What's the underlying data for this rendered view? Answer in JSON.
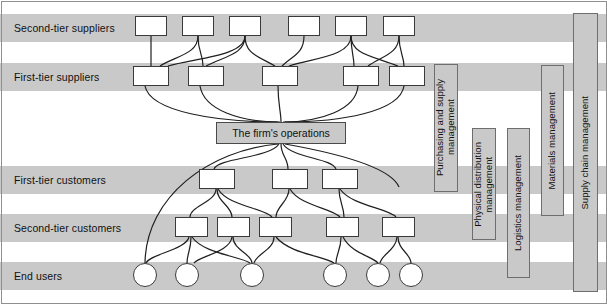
{
  "diagram": {
    "colors": {
      "band": "#c9c9c9",
      "node_fill": "#ffffff",
      "node_stroke": "#3a3a3a",
      "firm_fill": "#c9c9c9",
      "bar_fill": "#c9c9c9",
      "bar_stroke": "#6e6e6e",
      "text": "#111111",
      "frame": "#8f8f8f"
    },
    "rows": [
      {
        "id": "second-tier-suppliers",
        "label": "Second-tier suppliers",
        "band": {
          "y": 14,
          "h": 28
        },
        "label_x": 14,
        "label_y": 28,
        "node_shape": "box",
        "nodes": [
          {
            "x": 135,
            "y": 16,
            "w": 32,
            "h": 20
          },
          {
            "x": 182,
            "y": 16,
            "w": 32,
            "h": 20
          },
          {
            "x": 229,
            "y": 16,
            "w": 32,
            "h": 20
          },
          {
            "x": 288,
            "y": 16,
            "w": 32,
            "h": 20
          },
          {
            "x": 335,
            "y": 16,
            "w": 32,
            "h": 20
          },
          {
            "x": 383,
            "y": 16,
            "w": 32,
            "h": 20
          }
        ]
      },
      {
        "id": "first-tier-suppliers",
        "label": "First-tier suppliers",
        "band": {
          "y": 63,
          "h": 28
        },
        "label_x": 14,
        "label_y": 77,
        "node_shape": "box",
        "nodes": [
          {
            "x": 133,
            "y": 66,
            "w": 36,
            "h": 20
          },
          {
            "x": 188,
            "y": 66,
            "w": 36,
            "h": 20
          },
          {
            "x": 262,
            "y": 66,
            "w": 36,
            "h": 20
          },
          {
            "x": 343,
            "y": 66,
            "w": 36,
            "h": 20
          },
          {
            "x": 389,
            "y": 66,
            "w": 36,
            "h": 20
          }
        ]
      },
      {
        "id": "first-tier-customers",
        "label": "First-tier customers",
        "band": {
          "y": 166,
          "h": 28
        },
        "label_x": 14,
        "label_y": 180,
        "node_shape": "box",
        "nodes": [
          {
            "x": 199,
            "y": 169,
            "w": 36,
            "h": 20
          },
          {
            "x": 272,
            "y": 169,
            "w": 36,
            "h": 20
          },
          {
            "x": 322,
            "y": 169,
            "w": 36,
            "h": 20
          }
        ]
      },
      {
        "id": "second-tier-customers",
        "label": "Second-tier customers",
        "band": {
          "y": 214,
          "h": 28
        },
        "label_x": 14,
        "label_y": 228,
        "node_shape": "box",
        "nodes": [
          {
            "x": 175,
            "y": 217,
            "w": 33,
            "h": 20
          },
          {
            "x": 217,
            "y": 217,
            "w": 33,
            "h": 20
          },
          {
            "x": 259,
            "y": 217,
            "w": 33,
            "h": 20
          },
          {
            "x": 326,
            "y": 217,
            "w": 33,
            "h": 20
          },
          {
            "x": 382,
            "y": 217,
            "w": 33,
            "h": 20
          }
        ]
      },
      {
        "id": "end-users",
        "label": "End users",
        "band": {
          "y": 262,
          "h": 28
        },
        "label_x": 14,
        "label_y": 276,
        "node_shape": "circle",
        "nodes": [
          {
            "x": 133,
            "y": 263,
            "w": 24,
            "h": 24
          },
          {
            "x": 175,
            "y": 263,
            "w": 24,
            "h": 24
          },
          {
            "x": 240,
            "y": 263,
            "w": 24,
            "h": 24
          },
          {
            "x": 323,
            "y": 263,
            "w": 24,
            "h": 24
          },
          {
            "x": 366,
            "y": 263,
            "w": 24,
            "h": 24
          },
          {
            "x": 399,
            "y": 263,
            "w": 24,
            "h": 24
          }
        ]
      }
    ],
    "firm": {
      "label": "The firm's operations",
      "x": 216,
      "y": 122,
      "w": 130,
      "h": 22
    },
    "scope_bars": [
      {
        "id": "purchasing-and-supply-management",
        "label": "Purchasing and supply\nmanagement",
        "x": 434,
        "y": 64,
        "w": 24,
        "h": 128
      },
      {
        "id": "physical-distribution-management",
        "label": "Physical distribution\nmanagement",
        "x": 472,
        "y": 128,
        "w": 24,
        "h": 112
      },
      {
        "id": "logistics-management",
        "label": "Logistics management",
        "x": 507,
        "y": 128,
        "w": 23,
        "h": 150
      },
      {
        "id": "materials-management",
        "label": "Materials management",
        "x": 541,
        "y": 65,
        "w": 23,
        "h": 151
      },
      {
        "id": "supply-chain-management",
        "label": "Supply chain management",
        "x": 573,
        "y": 13,
        "w": 25,
        "h": 279
      }
    ],
    "edges": [
      {
        "from": [
          151,
          36
        ],
        "to": [
          151,
          66
        ],
        "c1": [
          151,
          48
        ],
        "c2": [
          151,
          56
        ]
      },
      {
        "from": [
          198,
          36
        ],
        "to": [
          160,
          66
        ],
        "c1": [
          198,
          54
        ],
        "c2": [
          176,
          56
        ]
      },
      {
        "from": [
          245,
          36
        ],
        "to": [
          168,
          66
        ],
        "c1": [
          245,
          56
        ],
        "c2": [
          196,
          58
        ]
      },
      {
        "from": [
          245,
          36
        ],
        "to": [
          206,
          66
        ],
        "c1": [
          245,
          54
        ],
        "c2": [
          226,
          56
        ]
      },
      {
        "from": [
          245,
          36
        ],
        "to": [
          275,
          66
        ],
        "c1": [
          245,
          54
        ],
        "c2": [
          258,
          56
        ]
      },
      {
        "from": [
          198,
          36
        ],
        "to": [
          203,
          66
        ],
        "c1": [
          198,
          52
        ],
        "c2": [
          203,
          54
        ]
      },
      {
        "from": [
          304,
          36
        ],
        "to": [
          282,
          66
        ],
        "c1": [
          304,
          54
        ],
        "c2": [
          292,
          56
        ]
      },
      {
        "from": [
          351,
          36
        ],
        "to": [
          289,
          66
        ],
        "c1": [
          351,
          56
        ],
        "c2": [
          315,
          58
        ]
      },
      {
        "from": [
          351,
          36
        ],
        "to": [
          354,
          66
        ],
        "c1": [
          351,
          52
        ],
        "c2": [
          354,
          56
        ]
      },
      {
        "from": [
          399,
          36
        ],
        "to": [
          368,
          66
        ],
        "c1": [
          399,
          54
        ],
        "c2": [
          382,
          56
        ]
      },
      {
        "from": [
          399,
          36
        ],
        "to": [
          404,
          66
        ],
        "c1": [
          399,
          52
        ],
        "c2": [
          404,
          56
        ]
      },
      {
        "from": [
          351,
          36
        ],
        "to": [
          398,
          66
        ],
        "c1": [
          351,
          54
        ],
        "c2": [
          372,
          56
        ]
      },
      {
        "from": [
          145,
          86
        ],
        "to": [
          278,
          122
        ],
        "c1": [
          150,
          112
        ],
        "c2": [
          218,
          122
        ]
      },
      {
        "from": [
          200,
          86
        ],
        "to": [
          280,
          122
        ],
        "c1": [
          204,
          110
        ],
        "c2": [
          240,
          122
        ]
      },
      {
        "from": [
          278,
          86
        ],
        "to": [
          281,
          122
        ],
        "c1": [
          278,
          104
        ],
        "c2": [
          281,
          112
        ]
      },
      {
        "from": [
          358,
          86
        ],
        "to": [
          283,
          122
        ],
        "c1": [
          356,
          110
        ],
        "c2": [
          320,
          122
        ]
      },
      {
        "from": [
          404,
          86
        ],
        "to": [
          285,
          122
        ],
        "c1": [
          400,
          112
        ],
        "c2": [
          340,
          122
        ]
      },
      {
        "from": [
          278,
          144
        ],
        "to": [
          145,
          263
        ],
        "c1": [
          210,
          150
        ],
        "c2": [
          146,
          196
        ]
      },
      {
        "from": [
          279,
          144
        ],
        "to": [
          214,
          169
        ],
        "c1": [
          270,
          158
        ],
        "c2": [
          218,
          158
        ]
      },
      {
        "from": [
          281,
          144
        ],
        "to": [
          288,
          169
        ],
        "c1": [
          281,
          156
        ],
        "c2": [
          288,
          158
        ]
      },
      {
        "from": [
          283,
          144
        ],
        "to": [
          336,
          169
        ],
        "c1": [
          292,
          158
        ],
        "c2": [
          332,
          158
        ]
      },
      {
        "from": [
          285,
          144
        ],
        "to": [
          399,
          187
        ],
        "c1": [
          330,
          152
        ],
        "c2": [
          390,
          166
        ]
      },
      {
        "from": [
          216,
          189
        ],
        "to": [
          190,
          217
        ],
        "c1": [
          216,
          202
        ],
        "c2": [
          190,
          206
        ]
      },
      {
        "from": [
          217,
          189
        ],
        "to": [
          232,
          217
        ],
        "c1": [
          217,
          202
        ],
        "c2": [
          232,
          206
        ]
      },
      {
        "from": [
          218,
          189
        ],
        "to": [
          272,
          217
        ],
        "c1": [
          228,
          206
        ],
        "c2": [
          264,
          208
        ]
      },
      {
        "from": [
          289,
          189
        ],
        "to": [
          276,
          217
        ],
        "c1": [
          289,
          202
        ],
        "c2": [
          276,
          206
        ]
      },
      {
        "from": [
          290,
          189
        ],
        "to": [
          340,
          217
        ],
        "c1": [
          300,
          206
        ],
        "c2": [
          332,
          208
        ]
      },
      {
        "from": [
          339,
          189
        ],
        "to": [
          344,
          217
        ],
        "c1": [
          339,
          202
        ],
        "c2": [
          344,
          206
        ]
      },
      {
        "from": [
          340,
          189
        ],
        "to": [
          396,
          217
        ],
        "c1": [
          352,
          206
        ],
        "c2": [
          388,
          208
        ]
      },
      {
        "from": [
          189,
          237
        ],
        "to": [
          146,
          263
        ],
        "c1": [
          186,
          250
        ],
        "c2": [
          150,
          254
        ]
      },
      {
        "from": [
          191,
          237
        ],
        "to": [
          187,
          263
        ],
        "c1": [
          191,
          250
        ],
        "c2": [
          187,
          254
        ]
      },
      {
        "from": [
          192,
          237
        ],
        "to": [
          250,
          263
        ],
        "c1": [
          204,
          254
        ],
        "c2": [
          240,
          256
        ]
      },
      {
        "from": [
          232,
          237
        ],
        "to": [
          194,
          263
        ],
        "c1": [
          230,
          252
        ],
        "c2": [
          200,
          256
        ]
      },
      {
        "from": [
          233,
          237
        ],
        "to": [
          252,
          263
        ],
        "c1": [
          233,
          250
        ],
        "c2": [
          252,
          254
        ]
      },
      {
        "from": [
          274,
          237
        ],
        "to": [
          254,
          263
        ],
        "c1": [
          274,
          250
        ],
        "c2": [
          256,
          254
        ]
      },
      {
        "from": [
          276,
          237
        ],
        "to": [
          334,
          263
        ],
        "c1": [
          290,
          254
        ],
        "c2": [
          324,
          256
        ]
      },
      {
        "from": [
          341,
          237
        ],
        "to": [
          336,
          263
        ],
        "c1": [
          341,
          250
        ],
        "c2": [
          336,
          254
        ]
      },
      {
        "from": [
          343,
          237
        ],
        "to": [
          378,
          263
        ],
        "c1": [
          352,
          254
        ],
        "c2": [
          372,
          256
        ]
      },
      {
        "from": [
          397,
          237
        ],
        "to": [
          380,
          263
        ],
        "c1": [
          396,
          250
        ],
        "c2": [
          382,
          254
        ]
      },
      {
        "from": [
          398,
          237
        ],
        "to": [
          411,
          263
        ],
        "c1": [
          398,
          250
        ],
        "c2": [
          411,
          254
        ]
      }
    ]
  }
}
